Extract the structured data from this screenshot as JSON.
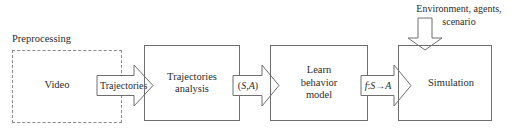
{
  "figure": {
    "type": "flow-diagram"
  },
  "groups": [
    {
      "id": "preprocessing",
      "caption": "Preprocessing",
      "style": "dashed"
    }
  ],
  "boxes": [
    {
      "id": "video",
      "label": "Video",
      "lines": [
        "Video"
      ],
      "style": "none"
    },
    {
      "id": "trajectories-analysis",
      "label": "Trajectories analysis",
      "lines": [
        "Trajectories",
        "analysis"
      ],
      "style": "solid"
    },
    {
      "id": "learn-behavior-model",
      "label": "Learn behavior model",
      "lines": [
        "Learn",
        "behavior",
        "model"
      ],
      "style": "solid"
    },
    {
      "id": "simulation",
      "label": "Simulation",
      "lines": [
        "Simulation"
      ],
      "style": "solid"
    }
  ],
  "arrows": [
    {
      "id": "trajectories",
      "label": "Trajectories",
      "direction": "right",
      "from": "video",
      "to": "trajectories-analysis"
    },
    {
      "id": "state-action",
      "label": "(S, A)",
      "label_parts": [
        {
          "text": "(",
          "italic": false
        },
        {
          "text": "S",
          "italic": true
        },
        {
          "text": ", ",
          "italic": false
        },
        {
          "text": "A",
          "italic": true
        },
        {
          "text": ")",
          "italic": false
        }
      ],
      "direction": "right",
      "from": "trajectories-analysis",
      "to": "learn-behavior-model"
    },
    {
      "id": "policy-function",
      "label": "f: S → A",
      "label_parts": [
        {
          "text": "f",
          "italic": true
        },
        {
          "text": ": ",
          "italic": false
        },
        {
          "text": "S",
          "italic": true
        },
        {
          "text": " → ",
          "italic": false
        },
        {
          "text": "A",
          "italic": true
        }
      ],
      "direction": "right",
      "from": "learn-behavior-model",
      "to": "simulation"
    },
    {
      "id": "environment-input",
      "label": "Environment, agents, scenario",
      "lines": [
        "Environment, agents,",
        "scenario"
      ],
      "direction": "down",
      "to": "simulation"
    }
  ],
  "colors": {
    "stroke_solid": "#6e6e6e",
    "stroke_dashed": "#8a8a8a",
    "text": "#2b2b2b",
    "background": "#ffffff"
  }
}
